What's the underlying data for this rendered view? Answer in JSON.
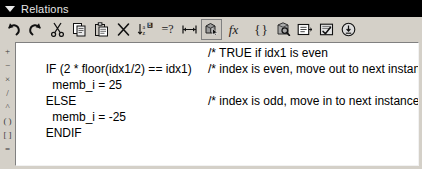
{
  "window": {
    "title": "Relations",
    "collapse_icon": "triangle-down-icon"
  },
  "toolbar": {
    "items": [
      {
        "name": "undo-button",
        "icon": "undo-arrow-icon",
        "glyph": "",
        "framed": false
      },
      {
        "name": "redo-button",
        "icon": "redo-arrow-icon",
        "glyph": "",
        "framed": false
      },
      {
        "name": "cut-button",
        "icon": "scissors-icon",
        "glyph": "",
        "framed": false
      },
      {
        "name": "copy-button",
        "icon": "copy-icon",
        "glyph": "",
        "framed": false
      },
      {
        "name": "paste-button",
        "icon": "paste-icon",
        "glyph": "",
        "framed": false
      },
      {
        "name": "delete-button",
        "icon": "close-x-icon",
        "glyph": "",
        "framed": false
      },
      {
        "name": "sort-button",
        "icon": "sort-az-icon",
        "glyph": "",
        "framed": false
      },
      {
        "name": "verify-button",
        "icon": "equals-question-icon",
        "glyph": "=?",
        "framed": false
      },
      {
        "name": "units-button",
        "icon": "dimension-arrow-icon",
        "glyph": "",
        "framed": false
      },
      {
        "name": "select-model-button",
        "icon": "pick-model-icon",
        "glyph": "",
        "framed": true
      },
      {
        "name": "functions-button",
        "icon": "fx-function-icon",
        "glyph": "fx",
        "framed": false
      },
      {
        "name": "units-bracket-button",
        "icon": "curly-brackets-icon",
        "glyph": "{ }",
        "framed": false
      },
      {
        "name": "parameters-button",
        "icon": "parameters-search-icon",
        "glyph": "",
        "framed": false
      },
      {
        "name": "notes-button",
        "icon": "note-list-icon",
        "glyph": "",
        "framed": false
      },
      {
        "name": "check-relations-button",
        "icon": "checkmark-page-icon",
        "glyph": "",
        "framed": false
      },
      {
        "name": "info-button",
        "icon": "info-circle-icon",
        "glyph": "",
        "framed": false
      }
    ]
  },
  "gutter": {
    "operators": [
      "+",
      "−",
      "×",
      "/",
      "^",
      "( )",
      "[ ]",
      "="
    ]
  },
  "editor": {
    "lines": [
      {
        "code": "IF (2 * floor(idx1/2) == idx1)",
        "comment": "/* TRUE if idx1 is even",
        "comment_x": 189
      },
      {
        "code": "  memb_i = 25",
        "comment": "/* index is even, move out to next instance",
        "comment_x": 189
      },
      {
        "code": "ELSE",
        "comment": "",
        "comment_x": 189
      },
      {
        "code": "  memb_i = -25",
        "comment": "/* index is odd, move in to next instance",
        "comment_x": 189
      },
      {
        "code": "ENDIF",
        "comment": "",
        "comment_x": 189
      }
    ]
  },
  "colors": {
    "titlebar_bg": "#000000",
    "titlebar_text": "#e6e6e6",
    "panel_bg": "#d4d0c8",
    "editor_bg": "#ffffff",
    "code_text": "#000000"
  }
}
